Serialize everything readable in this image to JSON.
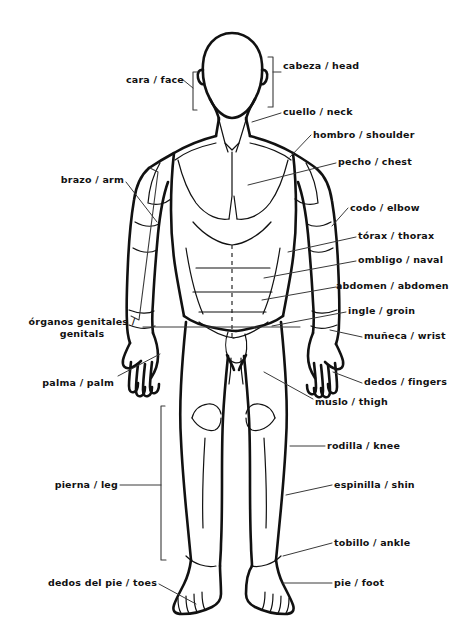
{
  "diagram": {
    "ink_color": "#111111",
    "leader_color": "#3a3a3a",
    "background_color": "#ffffff",
    "labels_right": [
      {
        "id": "cabeza",
        "text": "cabeza / head",
        "x": 283,
        "y": 66
      },
      {
        "id": "cuello",
        "text": "cuello / neck",
        "x": 283,
        "y": 110
      },
      {
        "id": "hombro",
        "text": "hombro / shoulder",
        "x": 313,
        "y": 135
      },
      {
        "id": "pecho",
        "text": "pecho / chest",
        "x": 338,
        "y": 161
      },
      {
        "id": "codo",
        "text": "codo / elbow",
        "x": 350,
        "y": 208
      },
      {
        "id": "torax",
        "text": "tórax / thorax",
        "x": 358,
        "y": 235
      },
      {
        "id": "ombligo",
        "text": "ombligo / naval",
        "x": 358,
        "y": 259
      },
      {
        "id": "abdomen",
        "text": "abdomen / abdomen",
        "x": 338,
        "y": 285
      },
      {
        "id": "ingle",
        "text": "ingle / groin",
        "x": 348,
        "y": 310
      },
      {
        "id": "muneca",
        "text": "muñeca / wrist",
        "x": 364,
        "y": 333
      },
      {
        "id": "dedos",
        "text": "dedos / fingers",
        "x": 364,
        "y": 378
      },
      {
        "id": "muslo",
        "text": "muslo / thigh",
        "x": 315,
        "y": 403
      },
      {
        "id": "rodilla",
        "text": "rodilla / knee",
        "x": 327,
        "y": 443
      },
      {
        "id": "espinilla",
        "text": "espinilla / shin",
        "x": 334,
        "y": 482
      },
      {
        "id": "tobillo",
        "text": "tobillo / ankle",
        "x": 334,
        "y": 541
      },
      {
        "id": "pie",
        "text": "pie / foot",
        "x": 334,
        "y": 578
      }
    ],
    "labels_left": [
      {
        "id": "cara",
        "text": "cara / face",
        "x": 104,
        "y": 79,
        "width": 80
      },
      {
        "id": "brazo",
        "text": "brazo / arm",
        "x": 48,
        "y": 178,
        "width": 76
      },
      {
        "id": "palma",
        "text": "palma / palm",
        "x": 28,
        "y": 381,
        "width": 86
      },
      {
        "id": "pierna",
        "text": "pierna / leg",
        "x": 38,
        "y": 482,
        "width": 80
      },
      {
        "id": "dedos-del-pie",
        "text": "dedos del pie / toes",
        "x": 33,
        "y": 581,
        "width": 124
      }
    ],
    "labels_left_multiline": [
      {
        "id": "organos-genitales",
        "line1": "órganos genitales /",
        "line2": "genitals",
        "x": 22,
        "y": 320,
        "width": 118
      }
    ]
  }
}
